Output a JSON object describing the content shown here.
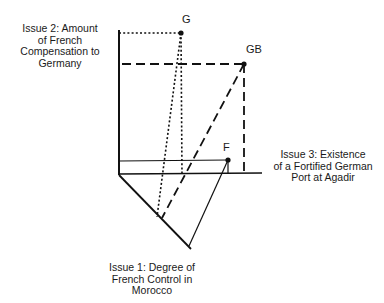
{
  "diagram": {
    "axes": {
      "issue2": {
        "label": "Issue 2:  Amount\nof French\nCompensation to\nGermany"
      },
      "issue3": {
        "label": "Issue 3:  Existence\nof a Fortified German\nPort at Agadir"
      },
      "issue1": {
        "label": "Issue 1:  Degree of\nFrench Control in\nMorocco"
      }
    },
    "points": [
      {
        "id": "G",
        "label": "G",
        "line_style": "dotted"
      },
      {
        "id": "GB",
        "label": "GB",
        "line_style": "dashed"
      },
      {
        "id": "F",
        "label": "F",
        "line_style": "solid"
      }
    ],
    "colors": {
      "ink": "#111111",
      "background": "#ffffff"
    }
  }
}
